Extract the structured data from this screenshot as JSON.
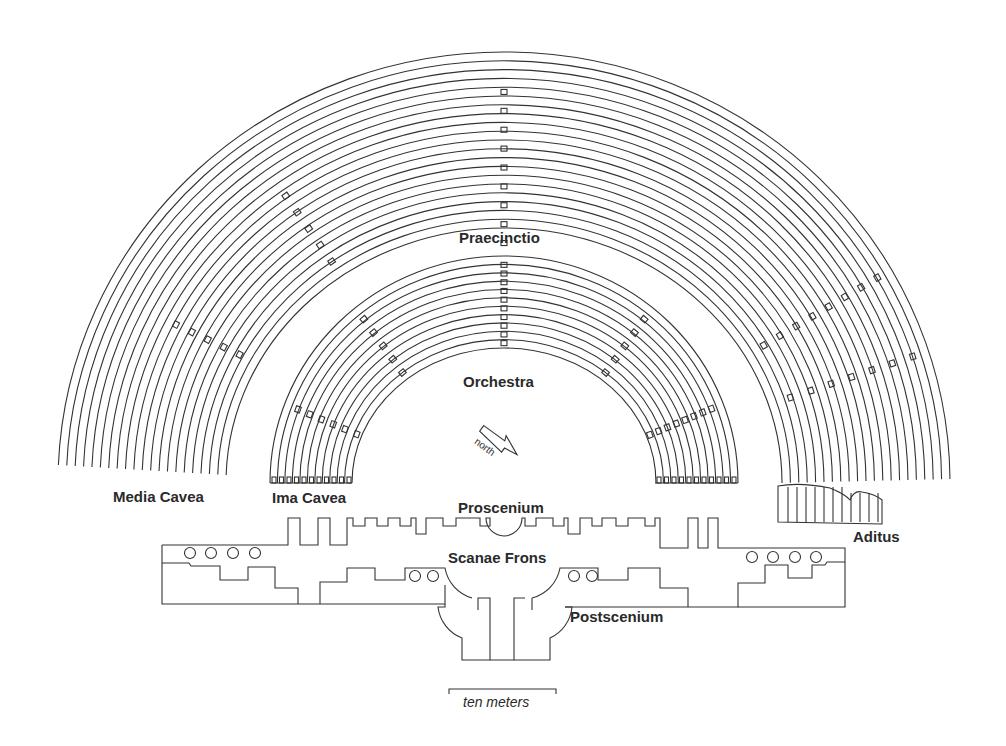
{
  "diagram": {
    "type": "roman-theater-plan",
    "labels": {
      "praecinctio": "Praecinctio",
      "orchestra": "Orchestra",
      "media_cavea": "Media Cavea",
      "ima_cavea": "Ima Cavea",
      "proscenium": "Proscenium",
      "scaenae_frons": "Scanae Frons",
      "postscenium": "Postscenium",
      "aditus": "Aditus"
    },
    "north_arrow": {
      "label": "north"
    },
    "scale_bar": {
      "label": "ten meters"
    },
    "colors": {
      "line": "#333333",
      "background": "#ffffff"
    }
  }
}
